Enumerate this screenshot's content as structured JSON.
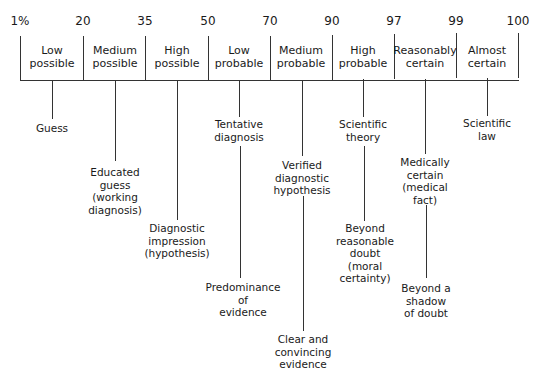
{
  "scale": {
    "ticks": [
      "1%",
      "20",
      "35",
      "50",
      "70",
      "90",
      "97",
      "99",
      "100"
    ]
  },
  "bands": [
    {
      "line1": "Low",
      "line2": "possible"
    },
    {
      "line1": "Medium",
      "line2": "possible"
    },
    {
      "line1": "High",
      "line2": "possible"
    },
    {
      "line1": "Low",
      "line2": "probable"
    },
    {
      "line1": "Medium",
      "line2": "probable"
    },
    {
      "line1": "High",
      "line2": "probable"
    },
    {
      "line1": "Reasonably",
      "line2": "certain"
    },
    {
      "line1": "Almost",
      "line2": "certain"
    }
  ],
  "clinical_labels": {
    "guess": [
      "Guess"
    ],
    "educated_guess": [
      "Educated",
      "guess",
      "(working",
      "diagnosis)"
    ],
    "diagnostic_impression": [
      "Diagnostic",
      "impression",
      "(hypothesis)"
    ],
    "tentative_diagnosis": [
      "Tentative",
      "diagnosis"
    ],
    "verified_hypothesis": [
      "Verified",
      "diagnostic",
      "hypothesis"
    ],
    "scientific_theory": [
      "Scientific",
      "theory"
    ],
    "medically_certain": [
      "Medically",
      "certain",
      "(medical",
      "fact)"
    ],
    "scientific_law": [
      "Scientific",
      "law"
    ]
  },
  "legal_labels": {
    "predominance": [
      "Predominance",
      "of",
      "evidence"
    ],
    "clear_convincing": [
      "Clear and",
      "convincing",
      "evidence"
    ],
    "beyond_reasonable_doubt": [
      "Beyond",
      "reasonable",
      "doubt",
      "(moral",
      "certainty)"
    ],
    "beyond_shadow": [
      "Beyond a",
      "shadow",
      "of doubt"
    ]
  }
}
